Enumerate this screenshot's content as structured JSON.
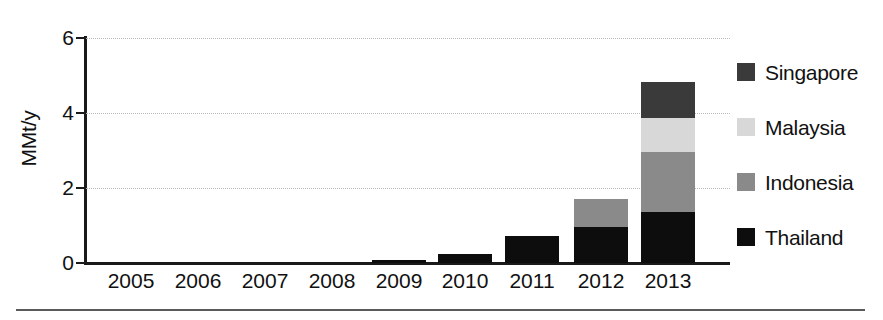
{
  "chart_data": {
    "type": "bar",
    "subtype": "stacked-bar",
    "title": "",
    "xlabel": "",
    "ylabel": "MMt/y",
    "ylim": [
      0,
      6
    ],
    "yticks": [
      0,
      2,
      4,
      6
    ],
    "ytick_labels": [
      "0",
      "2",
      "4",
      "6"
    ],
    "grid": true,
    "grid_axis": "y",
    "legend_position": "right",
    "categories": [
      "2005",
      "2006",
      "2007",
      "2008",
      "2009",
      "2010",
      "2011",
      "2012",
      "2013"
    ],
    "series": [
      {
        "name": "Thailand",
        "color": "#0d0d0d",
        "values": [
          0,
          0,
          0,
          0,
          0.07,
          0.24,
          0.72,
          0.96,
          1.36
        ]
      },
      {
        "name": "Indonesia",
        "color": "#8a8a8a",
        "values": [
          0,
          0,
          0,
          0,
          0,
          0,
          0,
          0.75,
          1.6
        ]
      },
      {
        "name": "Malaysia",
        "color": "#d8d8d8",
        "values": [
          0,
          0,
          0,
          0,
          0,
          0,
          0,
          0,
          0.91
        ]
      },
      {
        "name": "Singapore",
        "color": "#3a3a3a",
        "values": [
          0,
          0,
          0,
          0,
          0,
          0,
          0,
          0,
          0.96
        ]
      }
    ],
    "totals": [
      0,
      0,
      0,
      0,
      0.07,
      0.24,
      0.72,
      1.71,
      4.83
    ]
  },
  "axis": {
    "y_title": "MMt/y",
    "y_ticks": [
      "6",
      "4",
      "2",
      "0"
    ],
    "x_ticks": [
      "2005",
      "2006",
      "2007",
      "2008",
      "2009",
      "2010",
      "2011",
      "2012",
      "2013"
    ]
  },
  "legend": {
    "items": [
      {
        "label": "Singapore",
        "color": "#3a3a3a"
      },
      {
        "label": "Malaysia",
        "color": "#d8d8d8"
      },
      {
        "label": "Indonesia",
        "color": "#8a8a8a"
      },
      {
        "label": "Thailand",
        "color": "#0d0d0d"
      }
    ]
  },
  "colors": {
    "axis": "#1a1a1a",
    "grid": "#b9b9b9",
    "background": "#ffffff",
    "footer_rule": "#5a5a5a"
  }
}
